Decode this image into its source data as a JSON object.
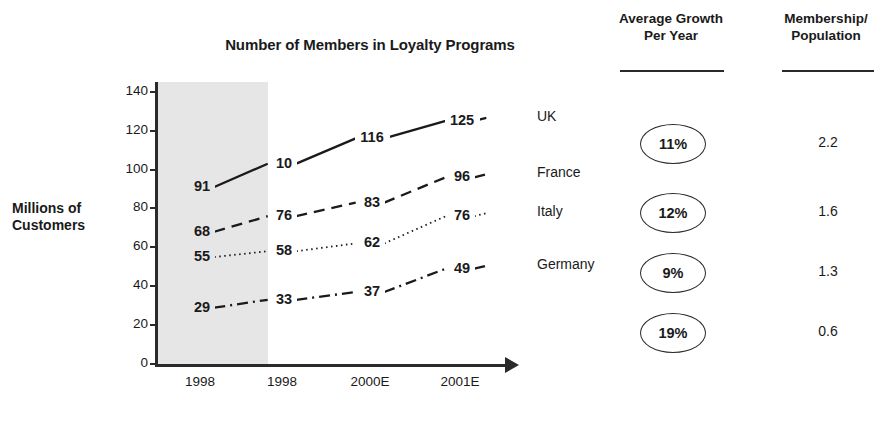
{
  "chart_data": {
    "type": "line",
    "title": "Number of Members in Loyalty Programs",
    "xlabel": "",
    "ylabel": "Millions of Customers",
    "ylim": [
      0,
      145
    ],
    "y_ticks": [
      "140",
      "120",
      "100",
      "80",
      "60",
      "40",
      "20",
      "0"
    ],
    "y_tick_values": [
      140,
      120,
      100,
      80,
      60,
      40,
      20,
      0
    ],
    "categories": [
      "1998",
      "1998",
      "2000E",
      "2001E"
    ],
    "grid": false,
    "legend": "right-of-line-ends",
    "shaded_band": {
      "from_category_index": 0,
      "to_category_index": 1,
      "color": "#e6e6e6"
    },
    "series": [
      {
        "name": "UK",
        "style": "solid",
        "values": [
          91,
          10,
          116,
          125
        ],
        "labels": [
          "91",
          "10",
          "116",
          "125"
        ]
      },
      {
        "name": "France",
        "style": "dashed",
        "values": [
          68,
          76,
          83,
          96
        ],
        "labels": [
          "68",
          "76",
          "83",
          "96"
        ]
      },
      {
        "name": "Italy",
        "style": "dotted",
        "values": [
          55,
          58,
          62,
          76
        ],
        "labels": [
          "55",
          "58",
          "62",
          "76"
        ]
      },
      {
        "name": "Germany",
        "style": "dash-dot",
        "values": [
          29,
          33,
          37,
          49
        ],
        "labels": [
          "29",
          "33",
          "37",
          "49"
        ]
      }
    ]
  },
  "columns": {
    "growth": {
      "header_line1": "Average Growth",
      "header_line2": "Per Year",
      "values": [
        "11%",
        "12%",
        "9%",
        "19%"
      ]
    },
    "ratio": {
      "header_line1": "Membership/",
      "header_line2": "Population",
      "values": [
        "2.2",
        "1.6",
        "1.3",
        "0.6"
      ]
    }
  },
  "colors": {
    "ink": "#1a1a1a",
    "axis": "#2a2a2a",
    "shade": "#e6e6e6",
    "background": "#ffffff"
  }
}
